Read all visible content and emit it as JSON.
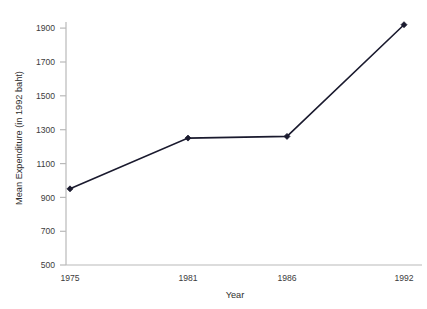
{
  "chart_data": {
    "type": "line",
    "title": "",
    "subtitle": "",
    "xlabel": "Year",
    "ylabel": "Mean Expenditure (in 1992 baht)",
    "categories": [
      "1975",
      "1981",
      "1986",
      "1992"
    ],
    "x": [
      1975,
      1981,
      1986,
      1992
    ],
    "values": [
      950,
      1250,
      1260,
      1920
    ],
    "series": [
      {
        "name": "Mean Expenditure",
        "values": [
          950,
          1250,
          1260,
          1920
        ]
      }
    ],
    "ylim": [
      500,
      1980
    ],
    "yticks": [
      500,
      700,
      900,
      1100,
      1300,
      1500,
      1700,
      1900
    ],
    "ytick_labels": [
      "500",
      "700",
      "900",
      "1100",
      "1300",
      "1500",
      "1700",
      "1900"
    ],
    "xtick_labels": [
      "1975",
      "1981",
      "1986",
      "1992"
    ],
    "grid": false,
    "legend": false,
    "legend_position": "none",
    "marker": "diamond",
    "line_color": "#1a1a2e",
    "marker_color": "#1a1a2e",
    "axis_color": "#b9b9b9",
    "text_color": "#3c3c3c",
    "background_color": "#ffffff"
  },
  "axes": {
    "y_title": "Mean Expenditure (in 1992 baht)",
    "x_title": "Year"
  },
  "ticks": {
    "y": [
      {
        "label": "1900"
      },
      {
        "label": "1700"
      },
      {
        "label": "1500"
      },
      {
        "label": "1300"
      },
      {
        "label": "1100"
      },
      {
        "label": "900"
      },
      {
        "label": "700"
      },
      {
        "label": "500"
      }
    ],
    "x": [
      {
        "label": "1975"
      },
      {
        "label": "1981"
      },
      {
        "label": "1986"
      },
      {
        "label": "1992"
      }
    ]
  }
}
